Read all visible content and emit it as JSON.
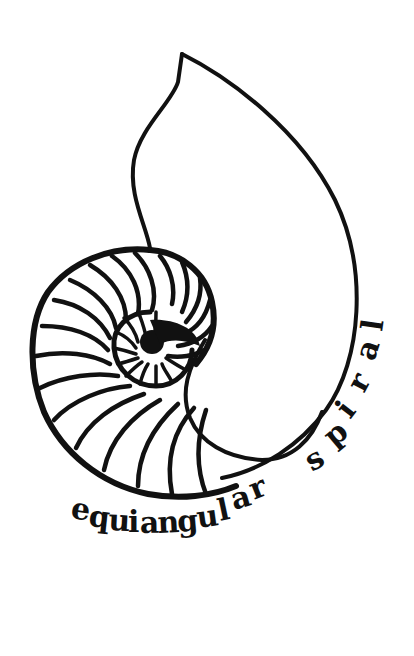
{
  "figure": {
    "caption_word_1": "equiangular",
    "caption_word_2": "spiral",
    "caption_letters_1": [
      "e",
      "q",
      "u",
      "i",
      "a",
      "n",
      "g",
      "u",
      "l",
      "a",
      "r"
    ],
    "caption_letters_2": [
      "s",
      "p",
      "i",
      "r",
      "a",
      "l"
    ],
    "ink_color": "#111111",
    "background_color": "#ffffff"
  }
}
